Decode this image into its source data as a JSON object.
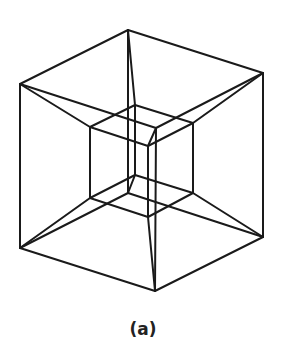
{
  "figure": {
    "caption": "(a)",
    "stroke_color": "#1a1a1a",
    "stroke_width": 2,
    "vertices": {
      "A": [
        128,
        30
      ],
      "B": [
        20,
        84
      ],
      "C": [
        263,
        73
      ],
      "P": [
        156,
        128
      ],
      "E": [
        20,
        248
      ],
      "G": [
        263,
        237
      ],
      "H": [
        155,
        291
      ],
      "Q": [
        128,
        193
      ],
      "a": [
        135,
        105
      ],
      "b": [
        90,
        127
      ],
      "c": [
        193,
        123
      ],
      "d": [
        148,
        146
      ],
      "e": [
        90,
        198
      ],
      "f": [
        135,
        175
      ],
      "g": [
        193,
        193
      ],
      "h": [
        148,
        217
      ]
    },
    "edges": [
      [
        "A",
        "B"
      ],
      [
        "A",
        "C"
      ],
      [
        "B",
        "P"
      ],
      [
        "C",
        "P"
      ],
      [
        "A",
        "Q"
      ],
      [
        "B",
        "E"
      ],
      [
        "C",
        "G"
      ],
      [
        "P",
        "H"
      ],
      [
        "E",
        "Q"
      ],
      [
        "G",
        "Q"
      ],
      [
        "E",
        "H"
      ],
      [
        "G",
        "H"
      ],
      [
        "a",
        "b"
      ],
      [
        "a",
        "c"
      ],
      [
        "b",
        "d"
      ],
      [
        "c",
        "d"
      ],
      [
        "a",
        "f"
      ],
      [
        "b",
        "e"
      ],
      [
        "c",
        "g"
      ],
      [
        "d",
        "h"
      ],
      [
        "e",
        "f"
      ],
      [
        "f",
        "g"
      ],
      [
        "e",
        "h"
      ],
      [
        "g",
        "h"
      ],
      [
        "A",
        "a"
      ],
      [
        "B",
        "b"
      ],
      [
        "C",
        "c"
      ],
      [
        "P",
        "d"
      ],
      [
        "Q",
        "f"
      ],
      [
        "E",
        "e"
      ],
      [
        "G",
        "g"
      ],
      [
        "H",
        "h"
      ]
    ]
  }
}
